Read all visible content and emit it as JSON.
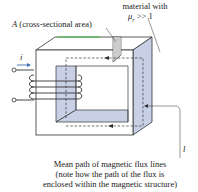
{
  "labels": {
    "material_line1": "material with",
    "material_mu": "μ",
    "material_sub": "r",
    "material_rest": " >> 1",
    "area_symbol": "A",
    "area_text": " (cross-sectional area)",
    "current": "i",
    "length": "l",
    "caption_line1": "Mean path of magnetic flux lines",
    "caption_line2": "(note how the path of the flux is",
    "caption_line3": "enclosed within the magnetic structure)"
  },
  "colors": {
    "core_face": "#ffffff",
    "core_shade": "#c8d0e6",
    "outline": "#333333",
    "top_edge_accent": "#3fbf3f",
    "arrow": "#3a6fb0"
  }
}
